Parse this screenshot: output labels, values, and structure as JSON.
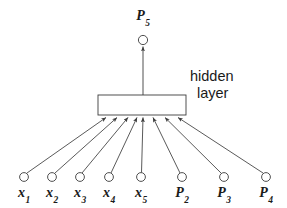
{
  "figure": {
    "kind": "neural-network-diagram",
    "background_color": "#ffffff",
    "stroke_color": "#3c3c3c",
    "text_color": "#1a1a1a"
  },
  "output_node": {
    "id": "P5",
    "label_base": "P",
    "label_sub": "5",
    "cx": 143,
    "cy": 40,
    "r": 4.6,
    "label_x": 143,
    "label_y": 9
  },
  "hidden_layer": {
    "caption_line1": "hidden",
    "caption_line2": "layer",
    "box": {
      "x": 98,
      "y": 95,
      "width": 88,
      "height": 20
    }
  },
  "input_nodes": [
    {
      "id": "x1",
      "label_base": "x",
      "label_sub": "1",
      "cx": 24,
      "cy": 177,
      "r": 4.4,
      "label_x": 24,
      "label_y": 186,
      "target_x": 106
    },
    {
      "id": "x2",
      "label_base": "x",
      "label_sub": "2",
      "cx": 52,
      "cy": 177,
      "r": 4.4,
      "label_x": 52,
      "label_y": 186,
      "target_x": 117
    },
    {
      "id": "x3",
      "label_base": "x",
      "label_sub": "3",
      "cx": 80,
      "cy": 177,
      "r": 4.4,
      "label_x": 80,
      "label_y": 186,
      "target_x": 128
    },
    {
      "id": "x4",
      "label_base": "x",
      "label_sub": "4",
      "cx": 109,
      "cy": 177,
      "r": 4.4,
      "label_x": 109,
      "label_y": 186,
      "target_x": 137
    },
    {
      "id": "x5",
      "label_base": "x",
      "label_sub": "5",
      "cx": 141,
      "cy": 177,
      "r": 4.4,
      "label_x": 141,
      "label_y": 186,
      "target_x": 143
    },
    {
      "id": "P2",
      "label_base": "P",
      "label_sub": "2",
      "cx": 182,
      "cy": 177,
      "r": 4.4,
      "label_x": 182,
      "label_y": 186,
      "target_x": 153
    },
    {
      "id": "P3",
      "label_base": "P",
      "label_sub": "3",
      "cx": 224,
      "cy": 177,
      "r": 4.4,
      "label_x": 224,
      "label_y": 186,
      "target_x": 165
    },
    {
      "id": "P4",
      "label_base": "P",
      "label_sub": "4",
      "cx": 266,
      "cy": 177,
      "r": 4.4,
      "label_x": 266,
      "label_y": 186,
      "target_x": 178
    }
  ],
  "output_edge": {
    "from_x": 143,
    "from_y": 95,
    "to_x": 143,
    "to_y": 45
  }
}
